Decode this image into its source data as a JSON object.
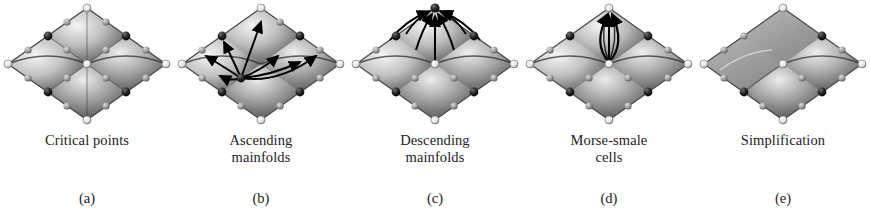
{
  "figure": {
    "background_color": "#ffffff",
    "text_color": "#1d1d1d",
    "panel_count": 5
  },
  "palette": {
    "surface_light": "#f2f2f2",
    "surface_mid": "#a8a8a8",
    "surface_dark": "#575757",
    "surface_edge": "#3a3a3a",
    "maximum_sphere": "#f5f5f5",
    "minimum_sphere": "#1a1a1a",
    "saddle_sphere": "#8e8e8e",
    "arrow_color": "#000000"
  },
  "panels": [
    {
      "id": "a",
      "sublabel": "(a)",
      "caption_line1": "Critical points",
      "caption_line2": "",
      "overlay": "none",
      "surface": "egg-carton-2x2",
      "description": "Shaded undulating surface with critical point spheres at maxima, minima and saddles"
    },
    {
      "id": "b",
      "sublabel": "(b)",
      "caption_line1": "Ascending",
      "caption_line2": "mainfolds",
      "overlay": "radiating-arrows",
      "surface": "egg-carton-2x2",
      "description": "Arrows radiating outward and upward from a minimum toward saddles and maxima"
    },
    {
      "id": "c",
      "sublabel": "(c)",
      "caption_line1": "Descending",
      "caption_line2": "mainfolds",
      "overlay": "converging-arrows",
      "surface": "egg-carton-2x2",
      "description": "Arrows converging upward into a maximum from surrounding saddles"
    },
    {
      "id": "d",
      "sublabel": "(d)",
      "caption_line1": "Morse-smale",
      "caption_line2": "cells",
      "overlay": "quad-cell",
      "surface": "egg-carton-2x2",
      "description": "A single quadrilateral Morse-Smale cell outlined with arrowed separatrices"
    },
    {
      "id": "e",
      "sublabel": "(e)",
      "caption_line1": "Simplification",
      "caption_line2": "",
      "overlay": "none",
      "surface": "egg-carton-simplified",
      "description": "Simplified surface with cancelled critical point pairs and fewer features"
    }
  ]
}
